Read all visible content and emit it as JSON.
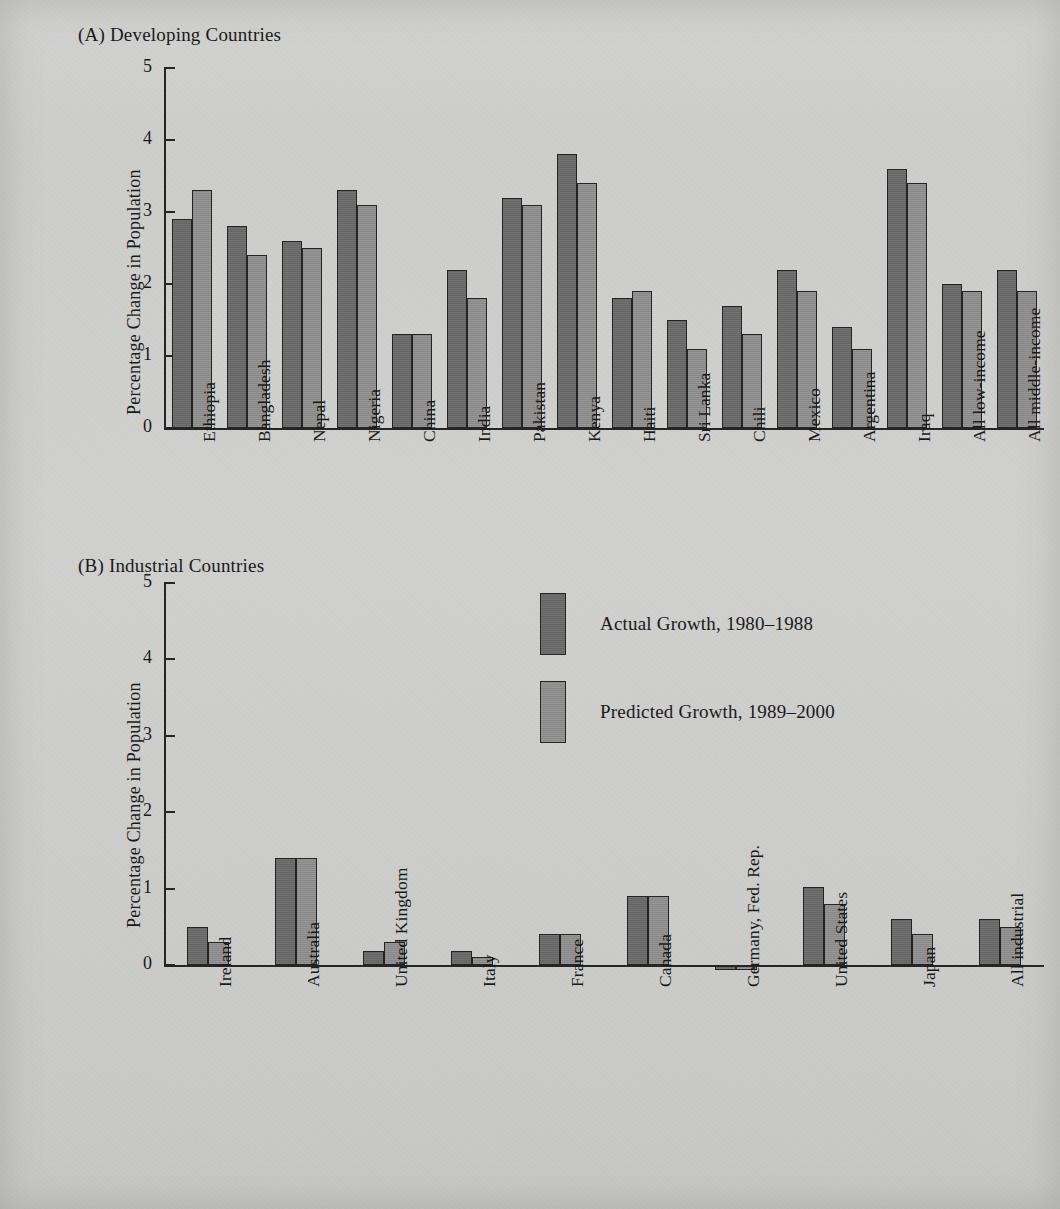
{
  "figure": {
    "background_color": "#cdcdcb",
    "bar_colors": {
      "actual": "#6a6a6a",
      "predicted": "#8e8e8e",
      "outline": "#242424"
    },
    "legend": {
      "actual_label": "Actual Growth, 1980–1988",
      "predicted_label": "Predicted Growth, 1989–2000"
    }
  },
  "panel_a": {
    "title": "(A)  Developing Countries",
    "ylabel": "Percentage Change in Population",
    "ticks": [
      "0",
      "1",
      "2",
      "3",
      "4",
      "5"
    ]
  },
  "panel_b": {
    "title": "(B)  Industrial Countries",
    "ylabel": "Percentage Change in Population",
    "ticks": [
      "0",
      "1",
      "2",
      "3",
      "4",
      "5"
    ]
  },
  "chart_data": [
    {
      "type": "bar",
      "title": "(A)  Developing Countries",
      "xlabel": "",
      "ylabel": "Percentage Change in Population",
      "ylim": [
        0,
        5
      ],
      "yticks": [
        0,
        1,
        2,
        3,
        4,
        5
      ],
      "grid": false,
      "legend_position": "panel-b-top-center",
      "categories": [
        "Ethiopia",
        "Bangladesh",
        "Nepal",
        "Nigeria",
        "China",
        "India",
        "Pakistan",
        "Kenya",
        "Haiti",
        "Sri Lanka",
        "Chili",
        "Mexico",
        "Argentina",
        "Iraq",
        "All low-income",
        "All middle-income"
      ],
      "series": [
        {
          "name": "Actual Growth, 1980–1988",
          "values": [
            2.9,
            2.8,
            2.6,
            3.3,
            1.3,
            2.2,
            3.2,
            3.8,
            1.8,
            1.5,
            1.7,
            2.2,
            1.4,
            3.6,
            2.0,
            2.2
          ]
        },
        {
          "name": "Predicted Growth, 1989–2000",
          "values": [
            3.3,
            2.4,
            2.5,
            3.1,
            1.3,
            1.8,
            3.1,
            3.4,
            1.9,
            1.1,
            1.3,
            1.9,
            1.1,
            3.4,
            1.9,
            1.9
          ]
        }
      ]
    },
    {
      "type": "bar",
      "title": "(B)  Industrial Countries",
      "xlabel": "",
      "ylabel": "Percentage Change in Population",
      "ylim": [
        0,
        5
      ],
      "yticks": [
        0,
        1,
        2,
        3,
        4,
        5
      ],
      "grid": false,
      "legend_position": "top-center",
      "categories": [
        "Ireland",
        "Australia",
        "United Kingdom",
        "Italy",
        "France",
        "Canada",
        "Germany, Fed. Rep.",
        "United States",
        "Japan",
        "All industrial"
      ],
      "series": [
        {
          "name": "Actual Growth, 1980–1988",
          "values": [
            0.5,
            1.4,
            0.18,
            0.18,
            0.4,
            0.9,
            -0.05,
            1.02,
            0.6,
            0.6
          ]
        },
        {
          "name": "Predicted Growth, 1989–2000",
          "values": [
            0.3,
            1.4,
            0.3,
            0.1,
            0.4,
            0.9,
            -0.05,
            0.8,
            0.4,
            0.5
          ]
        }
      ]
    }
  ]
}
